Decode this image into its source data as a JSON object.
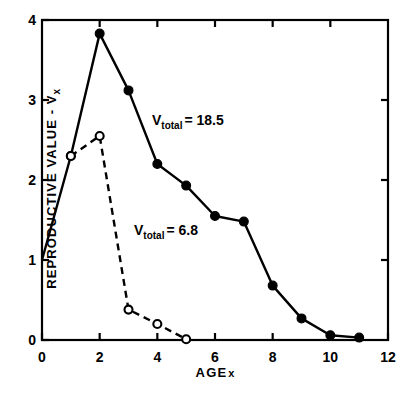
{
  "chart_data": {
    "type": "line",
    "title": "",
    "xlabel": "AGE x",
    "ylabel": "REPRODUCTIVE VALUE - Vx",
    "ylabel_main": "REPRODUCTIVE  VALUE  -  V",
    "ylabel_sub": "x",
    "xlabel_main": "AGE",
    "xlabel_sub": "x",
    "xlim": [
      0,
      12
    ],
    "ylim": [
      0,
      4
    ],
    "grid": false,
    "legend": "none",
    "xticks": [
      0,
      2,
      4,
      6,
      8,
      10,
      12
    ],
    "xtick_labels": [
      "0",
      "2",
      "4",
      "6",
      "8",
      "10",
      "12"
    ],
    "yticks": [
      0,
      1,
      2,
      3,
      4
    ],
    "ytick_labels": [
      "0",
      "1",
      "2",
      "3",
      "4"
    ],
    "series": [
      {
        "name": "Vtotal = 18.5",
        "style": "solid",
        "marker": "filled-circle",
        "x": [
          0,
          1,
          2,
          3,
          4,
          5,
          6,
          7,
          8,
          9,
          10,
          11
        ],
        "values": [
          1.0,
          2.3,
          3.83,
          3.12,
          2.2,
          1.93,
          1.55,
          1.48,
          0.68,
          0.27,
          0.06,
          0.03
        ],
        "marker_at_origin": false
      },
      {
        "name": "Vtotal = 6.8",
        "style": "dashed",
        "marker": "open-circle",
        "x": [
          1,
          2,
          3,
          4,
          5
        ],
        "values": [
          2.3,
          2.55,
          0.38,
          0.2,
          0.01
        ],
        "marker_at_origin": false
      }
    ],
    "annotations": [
      {
        "id": "vtotal-high",
        "text": "Vtotal = 18.5",
        "var": "V",
        "sub": "total",
        "eq": "= 18.5",
        "value": 18.5,
        "x_px": 152,
        "y_px": 112
      },
      {
        "id": "vtotal-low",
        "text": "Vtotal = 6.8",
        "var": "V",
        "sub": "total",
        "eq": "= 6.8",
        "value": 6.8,
        "x_px": 134,
        "y_px": 222
      }
    ],
    "colors": {
      "line": "#000000",
      "axis": "#000000",
      "background": "#ffffff"
    }
  }
}
